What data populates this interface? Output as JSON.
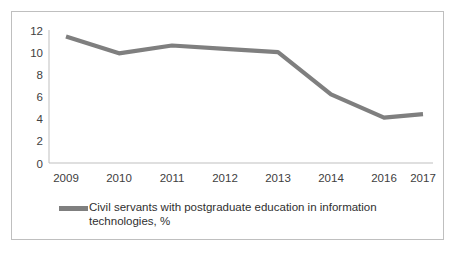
{
  "chart_data": {
    "type": "line",
    "title": "",
    "subtitle": "",
    "xlabel": "",
    "ylabel": "",
    "categories": [
      "2009",
      "2010",
      "2011",
      "2012",
      "2013",
      "2014",
      "2016",
      "2017"
    ],
    "values": [
      11.4,
      9.9,
      10.6,
      10.3,
      10.0,
      6.2,
      4.1,
      4.4
    ],
    "series": [
      {
        "name": "Civil servants with postgraduate education in information technologies, %",
        "values": [
          11.4,
          9.9,
          10.6,
          10.3,
          10.0,
          6.2,
          4.1,
          4.4
        ],
        "color": "#7f7f7f"
      }
    ],
    "ylim": [
      0,
      12
    ],
    "yticks": [
      0,
      2,
      4,
      6,
      8,
      10,
      12
    ],
    "ytick_labels": [
      "0",
      "2",
      "4",
      "6",
      "8",
      "10",
      "12"
    ],
    "xtick_labels": [
      "2009",
      "2010",
      "2011",
      "2012",
      "2013",
      "2014",
      "2016",
      "2017"
    ],
    "grid": false,
    "legend_position": "bottom",
    "legend_entries": [
      "Civil servants with postgraduate education in information technologies, %"
    ],
    "line_color": "#7f7f7f",
    "axis_color": "#bfbfbf",
    "border_color": "#bfbfbf",
    "annotations": []
  },
  "legend": {
    "label": "Civil servants with postgraduate education in information technologies, %"
  },
  "axes": {
    "y_labels": [
      "12",
      "10",
      "8",
      "6",
      "4",
      "2",
      "0"
    ],
    "x_labels": [
      "2009",
      "2010",
      "2011",
      "2012",
      "2013",
      "2014",
      "2016",
      "2017"
    ]
  }
}
